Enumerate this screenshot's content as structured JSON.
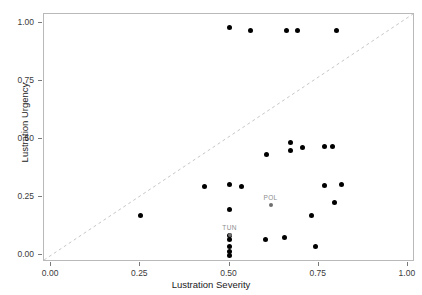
{
  "chart_data": {
    "type": "scatter",
    "title": "",
    "xlabel": "Lustration Severity",
    "ylabel": "Lustration Urgency",
    "xlim": [
      -0.02,
      1.02
    ],
    "ylim": [
      -0.03,
      1.04
    ],
    "grid": false,
    "legend": null,
    "xticks": [
      "0.00",
      "0.25",
      "0.50",
      "0.75",
      "1.00"
    ],
    "xtickvalues": [
      0.0,
      0.25,
      0.5,
      0.75,
      1.0
    ],
    "yticks": [
      "0.00",
      "0.25",
      "0.50",
      "0.75",
      "1.00"
    ],
    "ytickvalues": [
      0.0,
      0.25,
      0.5,
      0.75,
      1.0
    ],
    "reference_line": {
      "name": "identity-line",
      "style": "dashed",
      "color": "#c6c6c6",
      "from": [
        -0.02,
        -0.03
      ],
      "to": [
        1.02,
        1.04
      ]
    },
    "points": [
      {
        "x": 0.5,
        "y": 0.98
      },
      {
        "x": 0.56,
        "y": 0.97
      },
      {
        "x": 0.66,
        "y": 0.97
      },
      {
        "x": 0.69,
        "y": 0.97
      },
      {
        "x": 0.8,
        "y": 0.97
      },
      {
        "x": 0.67,
        "y": 0.485
      },
      {
        "x": 0.67,
        "y": 0.45
      },
      {
        "x": 0.705,
        "y": 0.465
      },
      {
        "x": 0.765,
        "y": 0.47
      },
      {
        "x": 0.79,
        "y": 0.47
      },
      {
        "x": 0.605,
        "y": 0.435
      },
      {
        "x": 0.43,
        "y": 0.295
      },
      {
        "x": 0.5,
        "y": 0.305
      },
      {
        "x": 0.535,
        "y": 0.295
      },
      {
        "x": 0.765,
        "y": 0.3
      },
      {
        "x": 0.815,
        "y": 0.305
      },
      {
        "x": 0.795,
        "y": 0.225
      },
      {
        "x": 0.5,
        "y": 0.195
      },
      {
        "x": 0.73,
        "y": 0.17
      },
      {
        "x": 0.25,
        "y": 0.17
      },
      {
        "x": 0.5,
        "y": 0.085
      },
      {
        "x": 0.5,
        "y": 0.065
      },
      {
        "x": 0.5,
        "y": 0.035
      },
      {
        "x": 0.5,
        "y": 0.015
      },
      {
        "x": 0.5,
        "y": 0.0
      },
      {
        "x": 0.6,
        "y": 0.065
      },
      {
        "x": 0.655,
        "y": 0.075
      },
      {
        "x": 0.74,
        "y": 0.035
      }
    ],
    "labeled_points": [
      {
        "label": "POL",
        "x": 0.615,
        "y": 0.215
      },
      {
        "label": "TUN",
        "x": 0.5,
        "y": 0.085
      }
    ]
  },
  "style": {
    "point_color": "#000000",
    "highlight_color": "#6f6f6f",
    "label_color": "#8d8d8d",
    "panel_border_color": "#b9b9b9",
    "axis_text_color": "#3b3b3b",
    "background": "#ffffff"
  }
}
